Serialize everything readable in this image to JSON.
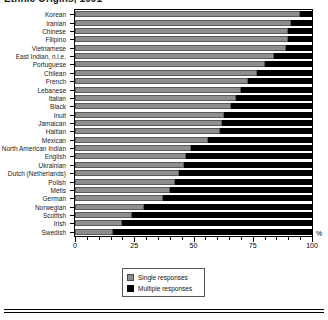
{
  "chart_data": {
    "type": "bar",
    "title": "Ethnic Origins, 1991",
    "xlabel": "%",
    "ylabel": "",
    "xlim": [
      0,
      100
    ],
    "grid": false,
    "orientation": "horizontal",
    "stacked": true,
    "legend_position": "bottom-center",
    "legend": [
      "Single responses",
      "Multiple responses"
    ],
    "xtick_labels": [
      "0",
      "25",
      "50",
      "75",
      "100"
    ],
    "xtick_values": [
      0,
      25,
      50,
      75,
      100
    ],
    "xtick_minor_step": 5,
    "categories": [
      "Korean",
      "Iranian",
      "Chinese",
      "Filipino",
      "Vietnamese",
      "East Indian, n.i.e.",
      "Portuguese",
      "Chilean",
      "French",
      "Lebanese",
      "Italian",
      "Black",
      "Inuit",
      "Jamaican",
      "Haitian",
      "Mexican",
      "North American Indian",
      "English",
      "Ukrainian",
      "Dutch (Netherlands)",
      "Polish",
      "Métis",
      "German",
      "Norwegian",
      "Scottish",
      "Irish",
      "Swedish"
    ],
    "series": [
      {
        "name": "Single responses",
        "color": "#8e8e8e",
        "values": [
          95,
          91,
          90,
          90,
          89,
          84,
          80,
          77,
          73,
          70,
          68,
          66,
          63,
          62,
          61,
          56,
          49,
          47,
          46,
          44,
          42,
          40,
          37,
          29,
          24,
          20,
          16
        ]
      },
      {
        "name": "Multiple responses",
        "color": "#000000",
        "values": [
          5,
          9,
          10,
          10,
          11,
          16,
          20,
          23,
          27,
          30,
          32,
          34,
          37,
          38,
          39,
          44,
          51,
          53,
          54,
          56,
          58,
          60,
          63,
          71,
          76,
          80,
          84
        ]
      }
    ]
  },
  "axis": {
    "unit_label": "%"
  },
  "legend": {
    "items": [
      {
        "label": "Single responses",
        "swatch": "single"
      },
      {
        "label": "Multiple responses",
        "swatch": "multiple"
      }
    ]
  }
}
